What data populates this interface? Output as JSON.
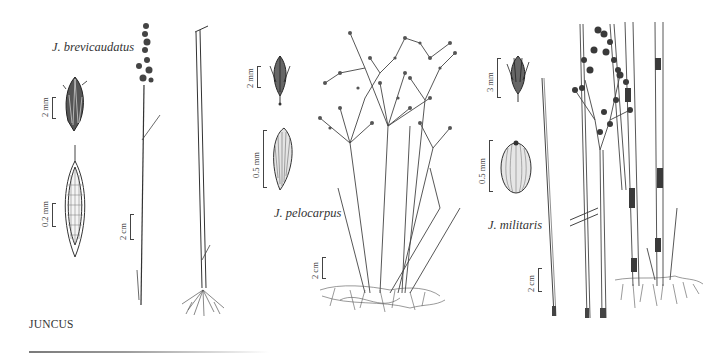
{
  "plate": {
    "genus_heading": "JUNCUS",
    "species": [
      {
        "name": "J. brevicaudatus",
        "scales": {
          "flower": "2 mm",
          "seed": "0.2 mm",
          "habit": "2 cm"
        }
      },
      {
        "name": "J. pelocarpus",
        "scales": {
          "flower": "2 mm",
          "seed": "0.5 mm",
          "habit": "2 cm"
        }
      },
      {
        "name": "J. militaris",
        "scales": {
          "flower": "3 mm",
          "seed": "0.5 mm",
          "habit": "2 cm"
        }
      }
    ]
  },
  "colors": {
    "ink": "#2a2a2a",
    "background": "#ffffff"
  }
}
